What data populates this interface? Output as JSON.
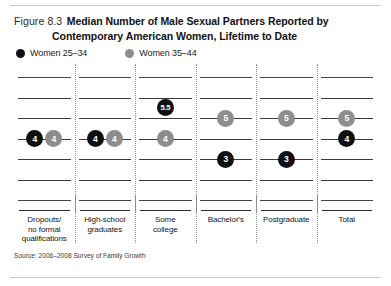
{
  "figure": {
    "number_label": "Figure 8.3",
    "title_line1": "Median Number of Male Sexual Partners Reported by",
    "title_line2": "Contemporary American Women, Lifetime to Date",
    "source": "Source: 2006–2008 Survey of Family Growth"
  },
  "legend": {
    "items": [
      {
        "label": "Women 25–34",
        "color": "#101010",
        "series_key": "women_25_34"
      },
      {
        "label": "Women 35–44",
        "color": "#8d8d8d",
        "series_key": "women_35_44"
      }
    ]
  },
  "colors": {
    "series_25_34": "#101010",
    "series_35_44": "#8d8d8d",
    "gridline": "#3a3a3a",
    "divider": "#8e8e8e",
    "text": "#141414"
  },
  "chart_data": {
    "type": "scatter",
    "title": "Median Number of Male Sexual Partners Reported by Contemporary American Women, Lifetime to Date",
    "xlabel": "",
    "ylabel": "",
    "grid": true,
    "legend_position": "top-left",
    "gridlines": [
      7,
      6,
      5,
      4,
      3,
      2,
      1
    ],
    "ylim": [
      0.5,
      7.5
    ],
    "categories": [
      "Dropouts/ no formal qualifications",
      "High-school graduates",
      "Some college",
      "Bachelor's",
      "Postgraduate",
      "Total"
    ],
    "category_lines": [
      [
        "Dropouts/",
        "no formal",
        "qualifications"
      ],
      [
        "High-school",
        "graduates"
      ],
      [
        "Some",
        "college"
      ],
      [
        "Bachelor's"
      ],
      [
        "Postgraduate"
      ],
      [
        "Total"
      ]
    ],
    "series": [
      {
        "name": "Women 25–34",
        "color": "#101010",
        "values": [
          4,
          4,
          5.5,
          3,
          3,
          4
        ],
        "labels": [
          "4",
          "4",
          "5.5",
          "3",
          "3",
          "4"
        ]
      },
      {
        "name": "Women 35–44",
        "color": "#8d8d8d",
        "values": [
          4,
          4,
          4,
          5,
          5,
          5
        ],
        "labels": [
          "4",
          "4",
          "4",
          "5",
          "5",
          "5"
        ]
      }
    ]
  }
}
